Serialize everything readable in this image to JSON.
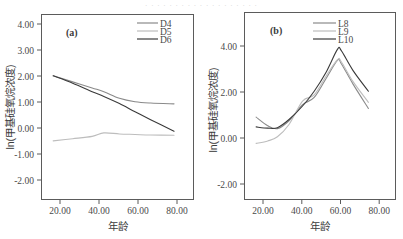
{
  "top_banner": {
    "text": "· · · · · · · · · · · · · · · · · · ·"
  },
  "figure": {
    "panels": [
      {
        "id": "a",
        "panel_label": "(a)",
        "xlabel": "年龄",
        "ylabel": "ln(甲基硅氧烷浓度)",
        "xticks": [
          "20.00",
          "40.00",
          "60.00",
          "80.00"
        ],
        "yticks": [
          "4.00",
          "3.00",
          "2.00",
          "1.00",
          "0.00",
          "-1.00",
          "-2.00"
        ],
        "legend": [
          {
            "label": "D4",
            "color": "#8a8a8a"
          },
          {
            "label": "D5",
            "color": "#bdbdbd"
          },
          {
            "label": "D6",
            "color": "#3a3a3a"
          }
        ]
      },
      {
        "id": "b",
        "panel_label": "(b)",
        "xlabel": "年龄",
        "ylabel": "ln(甲基硅氧烷浓度)",
        "xticks": [
          "20.00",
          "40.00",
          "60.00",
          "80.00"
        ],
        "yticks": [
          "4.00",
          "2.00",
          "0.00",
          "-2.00"
        ],
        "legend": [
          {
            "label": "L8",
            "color": "#8a8a8a"
          },
          {
            "label": "L9",
            "color": "#bdbdbd"
          },
          {
            "label": "L10",
            "color": "#3a3a3a"
          }
        ]
      }
    ]
  },
  "chart_data": [
    {
      "type": "line",
      "panel": "(a)",
      "title": "",
      "xlabel": "年龄",
      "ylabel": "ln(甲基硅氧烷浓度)",
      "xlim": [
        10,
        88
      ],
      "ylim": [
        -2.5,
        4.5
      ],
      "xticks": [
        20,
        40,
        60,
        80
      ],
      "yticks": [
        4.0,
        3.0,
        2.0,
        1.0,
        0.0,
        -1.0,
        -2.0
      ],
      "grid": false,
      "legend_position": "top-right",
      "x": [
        16,
        26,
        36,
        42,
        50,
        58,
        66,
        78
      ],
      "series": [
        {
          "name": "D4",
          "color": "#8a8a8a",
          "values": [
            2.18,
            1.95,
            1.72,
            1.58,
            1.33,
            1.2,
            1.15,
            1.12
          ]
        },
        {
          "name": "D5",
          "color": "#bdbdbd",
          "values": [
            -0.28,
            -0.2,
            -0.11,
            0.02,
            -0.02,
            -0.04,
            -0.06,
            -0.07
          ]
        },
        {
          "name": "D6",
          "color": "#3a3a3a",
          "values": [
            2.18,
            1.9,
            1.58,
            1.4,
            1.13,
            0.82,
            0.52,
            0.08
          ]
        }
      ]
    },
    {
      "type": "line",
      "panel": "(b)",
      "title": "",
      "xlabel": "年龄",
      "ylabel": "ln(甲基硅氧烷浓度)",
      "xlim": [
        10,
        88
      ],
      "ylim": [
        -2.8,
        4.8
      ],
      "xticks": [
        20,
        40,
        60,
        80
      ],
      "yticks": [
        4.0,
        2.0,
        0.0,
        -2.0
      ],
      "grid": false,
      "legend_position": "top-right",
      "x": [
        16,
        22,
        27,
        33,
        40,
        46,
        52,
        58,
        60,
        66,
        74
      ],
      "series": [
        {
          "name": "L8",
          "color": "#8a8a8a",
          "values": [
            0.55,
            0.2,
            0.08,
            0.4,
            1.05,
            1.35,
            2.1,
            2.85,
            2.72,
            1.9,
            0.9
          ]
        },
        {
          "name": "L9",
          "color": "#bdbdbd",
          "values": [
            -0.52,
            -0.42,
            -0.25,
            0.25,
            1.2,
            1.45,
            2.2,
            2.88,
            2.8,
            2.0,
            1.15
          ]
        },
        {
          "name": "L10",
          "color": "#3a3a3a",
          "values": [
            0.15,
            0.1,
            0.12,
            0.45,
            1.0,
            1.6,
            2.35,
            3.3,
            3.25,
            2.45,
            1.6
          ]
        }
      ]
    }
  ]
}
